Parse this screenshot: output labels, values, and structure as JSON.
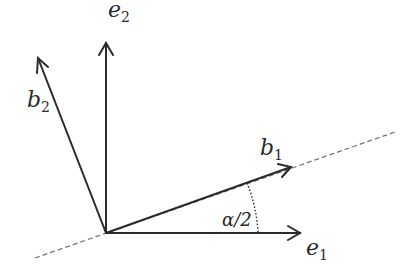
{
  "diagram": {
    "vectors": [
      {
        "id": "e1",
        "base": "e",
        "sub": "1"
      },
      {
        "id": "e2",
        "base": "e",
        "sub": "2"
      },
      {
        "id": "b1",
        "base": "b",
        "sub": "1"
      },
      {
        "id": "b2",
        "base": "b",
        "sub": "2"
      }
    ],
    "angle_label": "α/2",
    "stroke_color": "#2a2a2a",
    "dashed_color": "#777777"
  }
}
